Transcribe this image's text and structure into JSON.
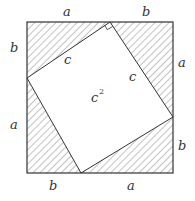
{
  "diagram": {
    "title": "",
    "outer_square": {
      "x0": 27,
      "y0": 22,
      "x1": 173,
      "y1": 173,
      "stroke": "#333333"
    },
    "inner_square": {
      "vertices": [
        [
          110,
          22
        ],
        [
          173,
          117
        ],
        [
          81,
          173
        ],
        [
          27,
          78
        ]
      ],
      "fill": "#ffffff",
      "stroke": "#333333"
    },
    "hatch": {
      "color": "#555555",
      "spacing": 5,
      "angle_deg": 45
    },
    "labels": {
      "top_a": "a",
      "top_b": "b",
      "left_b": "b",
      "left_a": "a",
      "right_a": "a",
      "right_b": "b",
      "bottom_b": "b",
      "bottom_a": "a",
      "hyp_top_left": "c",
      "hyp_top_right": "c",
      "area_base": "c",
      "area_exp": "2"
    },
    "right_angle_marker_at": [
      110,
      22
    ]
  }
}
